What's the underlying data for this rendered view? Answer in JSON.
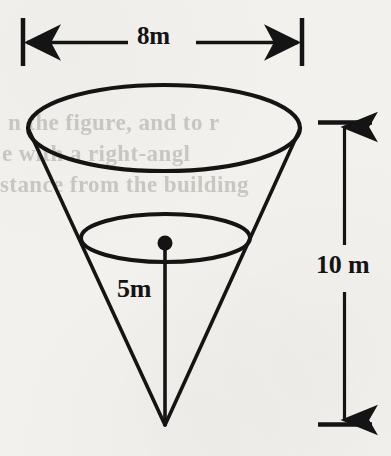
{
  "figure": {
    "type": "geometry-diagram",
    "shape": "inverted-cone",
    "background_color": "#f2f1ed",
    "ink_color": "#141414",
    "labels": {
      "top_diameter": "8m",
      "height": "10 m",
      "depth": "5m"
    },
    "dimensions": {
      "top_diameter_line": {
        "name": "8m",
        "orientation": "horizontal",
        "arrow_style": "double-headed-outward",
        "end_ticks": "vertical",
        "x_start": 22,
        "x_end": 303,
        "y": 42
      },
      "height_line": {
        "name": "10 m",
        "orientation": "vertical",
        "arrow_style": "double-headed-outward",
        "end_ticks": "horizontal",
        "x": 344,
        "y_start": 122,
        "y_end": 425
      },
      "depth_line": {
        "name": "5m",
        "orientation": "vertical",
        "from": "inner-ellipse-center",
        "to": "cone-apex",
        "x": 165,
        "y_start": 243,
        "y_end": 425
      }
    },
    "geometry": {
      "top_ellipse": {
        "cx": 164,
        "cy": 128,
        "rx": 136,
        "ry": 43
      },
      "inner_ellipse": {
        "cx": 165.5,
        "cy": 238,
        "rx": 84.5,
        "ry": 24
      },
      "apex": {
        "x": 165,
        "y": 425
      },
      "center_dot": {
        "cx": 165,
        "cy": 243,
        "r": 7
      }
    }
  },
  "background_showthrough": {
    "note": "faint reversed print bleeding through the scanned page",
    "lines": [
      "n the figure, and to r",
      "e with a right-angl",
      "stance from the building"
    ]
  }
}
